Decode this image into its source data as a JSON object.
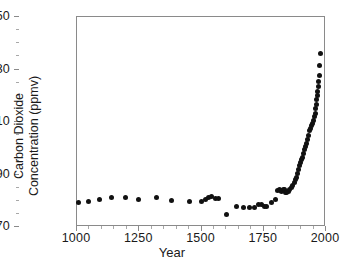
{
  "chart_data": {
    "type": "scatter",
    "title": "",
    "xlabel": "Year",
    "ylabel": "Carbon  Dioxide\nConcentration  (ppmv)",
    "xlim": [
      1000,
      2000
    ],
    "ylim": [
      270,
      350
    ],
    "xticks": [
      1000,
      1250,
      1500,
      1750,
      2000
    ],
    "xtick_labels": [
      "1000",
      "1250",
      "1500",
      "1750",
      "2000"
    ],
    "xminor_step": 50,
    "yticks": [
      270,
      290,
      310,
      330,
      350
    ],
    "ytick_labels": [
      "270",
      "290",
      "310",
      "330",
      "350"
    ],
    "yminor_step": 5,
    "grid": false,
    "legend": null,
    "marker": "filled-circle",
    "marker_color": "#111111",
    "marker_size_px": 5,
    "series": [
      {
        "name": "Atmospheric CO2 concentration",
        "x": [
          1006,
          1048,
          1090,
          1140,
          1194,
          1245,
          1320,
          1381,
          1450,
          1498,
          1516,
          1528,
          1540,
          1556,
          1568,
          1600,
          1640,
          1670,
          1692,
          1712,
          1730,
          1742,
          1752,
          1762,
          1780,
          1796,
          1806,
          1812,
          1818,
          1822,
          1828,
          1832,
          1838,
          1842,
          1848,
          1854,
          1860,
          1866,
          1872,
          1876,
          1880,
          1884,
          1888,
          1892,
          1896,
          1900,
          1904,
          1908,
          1912,
          1916,
          1920,
          1924,
          1928,
          1932,
          1936,
          1940,
          1944,
          1948,
          1952,
          1956,
          1958,
          1960,
          1962,
          1964,
          1966,
          1968,
          1970,
          1972,
          1974,
          1976
        ],
        "y": [
          279.2,
          279.6,
          280.4,
          281.2,
          281.2,
          280.4,
          281.2,
          280.0,
          279.8,
          279.6,
          280.4,
          281.4,
          281.6,
          281.0,
          281.0,
          274.6,
          278.0,
          277.6,
          277.4,
          277.6,
          278.4,
          278.6,
          278.0,
          277.8,
          279.4,
          280.6,
          283.8,
          284.2,
          284.0,
          283.4,
          284.2,
          284.4,
          283.0,
          283.0,
          283.4,
          284.2,
          285.2,
          286.0,
          287.0,
          288.0,
          289.0,
          290.2,
          292.0,
          293.4,
          294.4,
          295.6,
          296.6,
          298.0,
          299.4,
          300.6,
          302.0,
          303.4,
          305.0,
          306.6,
          307.6,
          308.8,
          309.6,
          310.6,
          312.0,
          313.4,
          315.0,
          316.6,
          318.4,
          320.0,
          321.6,
          323.4,
          325.4,
          327.6,
          331.6,
          336.0
        ]
      }
    ]
  }
}
